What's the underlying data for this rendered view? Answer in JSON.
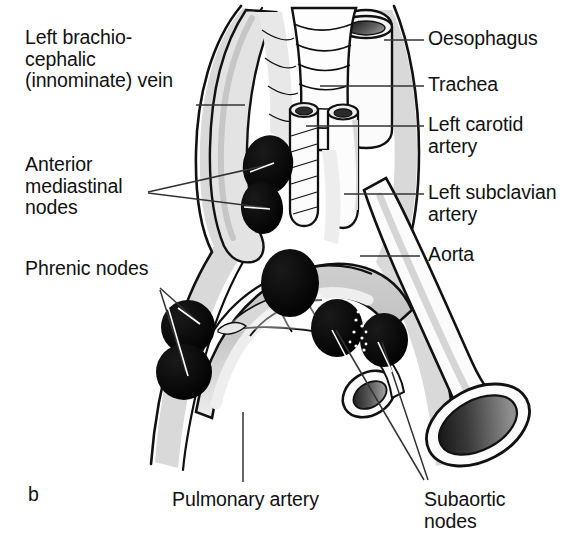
{
  "figure": {
    "letter": "b",
    "caption_letter_position": "bottom-left",
    "background_color": "#ffffff",
    "ink_color": "#111111",
    "shading_light": "#d9d9d9",
    "shading_mid": "#b9b9b9",
    "node_color": "#000000"
  },
  "labels": {
    "left_brachiocephalic_vein": "Left brachio-\ncephalic\n(innominate) vein",
    "anterior_mediastinal_nodes": "Anterior\nmediastinal\nnodes",
    "phrenic_nodes": "Phrenic nodes",
    "oesophagus": "Oesophagus",
    "trachea": "Trachea",
    "left_carotid_artery": "Left carotid\nartery",
    "left_subclavian_artery": "Left subclavian\nartery",
    "aorta": "Aorta",
    "pulmonary_artery": "Pulmonary artery",
    "subaortic_nodes": "Subaortic\nnodes"
  },
  "structures": [
    {
      "name": "oesophagus",
      "type": "tube-cut-end",
      "side": "posterior-right"
    },
    {
      "name": "trachea",
      "type": "ringed-tube",
      "side": "midline"
    },
    {
      "name": "left-carotid-artery",
      "type": "vessel-tube",
      "side": "midline-left"
    },
    {
      "name": "left-subclavian-artery",
      "type": "vessel-tube",
      "side": "midline-right"
    },
    {
      "name": "aorta",
      "type": "arch-vessel-cut-end",
      "side": "right"
    },
    {
      "name": "pulmonary-artery",
      "type": "vessel-cut-end",
      "side": "centre"
    },
    {
      "name": "left-brachiocephalic-vein",
      "type": "vein-band",
      "side": "left"
    },
    {
      "name": "anterior-mediastinal-nodes",
      "type": "lymph-node-group",
      "count": 2
    },
    {
      "name": "phrenic-nodes",
      "type": "lymph-node-group",
      "count": 2
    },
    {
      "name": "subaortic-nodes",
      "type": "lymph-node-group",
      "count": 2
    }
  ]
}
